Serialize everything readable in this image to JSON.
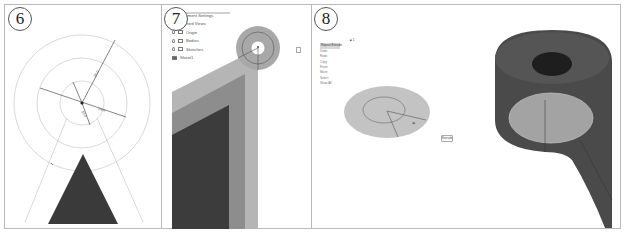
{
  "figure": {
    "panels": [
      {
        "step": "6",
        "description": "Sketch with concentric construction circles, dimensions and triangle",
        "dimensions": [
          "26.0",
          "24.0",
          "10.0"
        ]
      },
      {
        "step": "7",
        "description": "Browser tree and close-up of extruded part with circular sketch",
        "browser": {
          "items": [
            {
              "label": "Document Settings",
              "icon": "gear-icon"
            },
            {
              "label": "Named Views",
              "icon": "folder-icon"
            },
            {
              "label": "Origin",
              "icon": "folder-icon"
            },
            {
              "label": "Bodies",
              "icon": "folder-icon"
            },
            {
              "label": "Sketches",
              "icon": "folder-icon"
            },
            {
              "label": "Sheet1",
              "icon": "sheet-icon"
            }
          ]
        }
      },
      {
        "step": "8",
        "description": "Sketch profile selected with context menu, and resulting 3D bracket",
        "menu": {
          "header_marker": "■ 1",
          "items": [
            "Repeat Extrude",
            "Undo",
            "Redo",
            "Copy",
            "Paste",
            "Move",
            "Select",
            "Show All"
          ]
        },
        "ok_label": "Extrude"
      }
    ]
  }
}
